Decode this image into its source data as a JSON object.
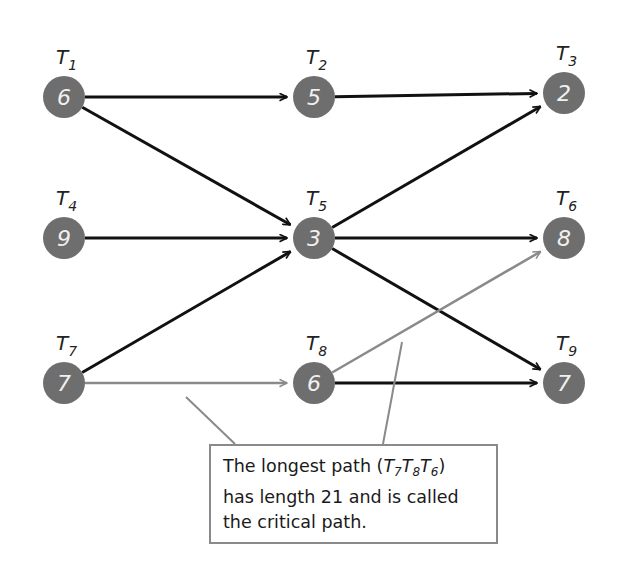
{
  "diagram": {
    "nodes": [
      {
        "id": "T1",
        "label": "T",
        "sub": "1",
        "value": "6",
        "x": 64,
        "y": 97
      },
      {
        "id": "T2",
        "label": "T",
        "sub": "2",
        "value": "5",
        "x": 314,
        "y": 97
      },
      {
        "id": "T3",
        "label": "T",
        "sub": "3",
        "value": "2",
        "x": 564,
        "y": 93
      },
      {
        "id": "T4",
        "label": "T",
        "sub": "4",
        "value": "9",
        "x": 64,
        "y": 238
      },
      {
        "id": "T5",
        "label": "T",
        "sub": "5",
        "value": "3",
        "x": 314,
        "y": 238
      },
      {
        "id": "T6",
        "label": "T",
        "sub": "6",
        "value": "8",
        "x": 564,
        "y": 238
      },
      {
        "id": "T7",
        "label": "T",
        "sub": "7",
        "value": "7",
        "x": 64,
        "y": 383
      },
      {
        "id": "T8",
        "label": "T",
        "sub": "8",
        "value": "6",
        "x": 314,
        "y": 383
      },
      {
        "id": "T9",
        "label": "T",
        "sub": "9",
        "value": "7",
        "x": 564,
        "y": 383
      }
    ],
    "edges": [
      {
        "from": "T1",
        "to": "T2",
        "style": "black"
      },
      {
        "from": "T2",
        "to": "T3",
        "style": "black"
      },
      {
        "from": "T1",
        "to": "T5",
        "style": "black"
      },
      {
        "from": "T4",
        "to": "T5",
        "style": "black"
      },
      {
        "from": "T7",
        "to": "T5",
        "style": "black"
      },
      {
        "from": "T5",
        "to": "T3",
        "style": "black"
      },
      {
        "from": "T5",
        "to": "T6",
        "style": "black"
      },
      {
        "from": "T5",
        "to": "T9",
        "style": "black"
      },
      {
        "from": "T8",
        "to": "T9",
        "style": "black"
      },
      {
        "from": "T7",
        "to": "T8",
        "style": "gray"
      },
      {
        "from": "T8",
        "to": "T6",
        "style": "gray"
      }
    ],
    "critical_path": [
      "T7",
      "T8",
      "T6"
    ],
    "critical_length": 21,
    "colors": {
      "node_fill": "#6e6e6e",
      "node_text": "#f0f0f0",
      "edge": "#111111",
      "critical_edge": "#8a8a8a"
    }
  },
  "callout": {
    "line1_prefix": "The longest path (",
    "line1_path": [
      {
        "t": "T",
        "sub": "7"
      },
      {
        "t": "T",
        "sub": "8"
      },
      {
        "t": "T",
        "sub": "6"
      }
    ],
    "line1_suffix": ")",
    "line2": "has length 21 and is called",
    "line3": "the critical path."
  }
}
